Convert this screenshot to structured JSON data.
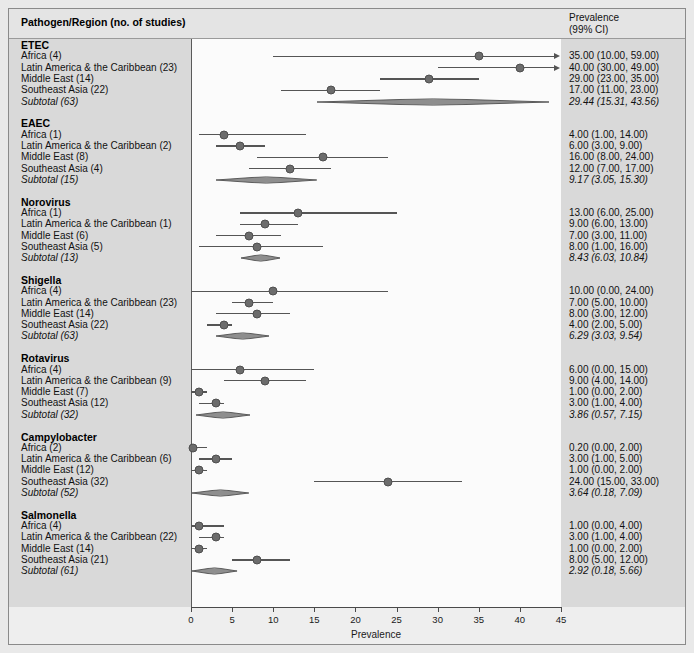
{
  "header": {
    "left_title": "Pathogen/Region (no. of studies)",
    "right_title_line1": "Prevalence",
    "right_title_line2": "(99% CI)"
  },
  "axis": {
    "title": "Prevalence",
    "ticks": [
      "0",
      "5",
      "10",
      "15",
      "20",
      "25",
      "30",
      "35",
      "40",
      "45"
    ],
    "min": 0,
    "max": 45
  },
  "colors": {
    "marker": "#6c6c6c",
    "line": "#555555",
    "panel": "#fbfbfb",
    "band": "#d9d9d9",
    "figure_bg": "#eeeeee"
  },
  "chart_data": {
    "type": "forest",
    "title": "",
    "xlabel": "Prevalence",
    "ylabel": "",
    "xlim": [
      0,
      45
    ],
    "grid": false,
    "legend": "none",
    "ci_level": "99% CI",
    "groups": [
      {
        "name": "ETEC",
        "rows": [
          {
            "label": "Africa (4)",
            "studies": 4,
            "est": 35.0,
            "lo": 10.0,
            "hi": 59.0,
            "text": "35.00 (10.00, 59.00)",
            "truncated_right": true,
            "subtotal": false
          },
          {
            "label": "Latin America & the Caribbean (23)",
            "studies": 23,
            "est": 40.0,
            "lo": 30.0,
            "hi": 49.0,
            "text": "40.00 (30.00, 49.00)",
            "truncated_right": true,
            "subtotal": false
          },
          {
            "label": "Middle East (14)",
            "studies": 14,
            "est": 29.0,
            "lo": 23.0,
            "hi": 35.0,
            "text": "29.00 (23.00, 35.00)",
            "truncated_right": false,
            "subtotal": false
          },
          {
            "label": "Southeast Asia (22)",
            "studies": 22,
            "est": 17.0,
            "lo": 11.0,
            "hi": 23.0,
            "text": "17.00 (11.00, 23.00)",
            "truncated_right": false,
            "subtotal": false
          },
          {
            "label": "Subtotal  (63)",
            "studies": 63,
            "est": 29.44,
            "lo": 15.31,
            "hi": 43.56,
            "text": "29.44 (15.31, 43.56)",
            "truncated_right": false,
            "subtotal": true
          }
        ]
      },
      {
        "name": "EAEC",
        "rows": [
          {
            "label": "Africa (1)",
            "studies": 1,
            "est": 4.0,
            "lo": 1.0,
            "hi": 14.0,
            "text": "4.00 (1.00, 14.00)",
            "truncated_right": false,
            "subtotal": false
          },
          {
            "label": "Latin America & the Caribbean (2)",
            "studies": 2,
            "est": 6.0,
            "lo": 3.0,
            "hi": 9.0,
            "text": "6.00 (3.00, 9.00)",
            "truncated_right": false,
            "subtotal": false
          },
          {
            "label": "Middle East (8)",
            "studies": 8,
            "est": 16.0,
            "lo": 8.0,
            "hi": 24.0,
            "text": "16.00 (8.00, 24.00)",
            "truncated_right": false,
            "subtotal": false
          },
          {
            "label": "Southeast Asia (4)",
            "studies": 4,
            "est": 12.0,
            "lo": 7.0,
            "hi": 17.0,
            "text": "12.00 (7.00, 17.00)",
            "truncated_right": false,
            "subtotal": false
          },
          {
            "label": "Subtotal (15)",
            "studies": 15,
            "est": 9.17,
            "lo": 3.05,
            "hi": 15.3,
            "text": "9.17 (3.05, 15.30)",
            "truncated_right": false,
            "subtotal": true
          }
        ]
      },
      {
        "name": "Norovirus",
        "rows": [
          {
            "label": "Africa (1)",
            "studies": 1,
            "est": 13.0,
            "lo": 6.0,
            "hi": 25.0,
            "text": "13.00 (6.00, 25.00)",
            "truncated_right": false,
            "subtotal": false
          },
          {
            "label": "Latin America & the Caribbean (1)",
            "studies": 1,
            "est": 9.0,
            "lo": 6.0,
            "hi": 13.0,
            "text": "9.00 (6.00, 13.00)",
            "truncated_right": false,
            "subtotal": false
          },
          {
            "label": "Middle East (6)",
            "studies": 6,
            "est": 7.0,
            "lo": 3.0,
            "hi": 11.0,
            "text": "7.00 (3.00, 11.00)",
            "truncated_right": false,
            "subtotal": false
          },
          {
            "label": "Southeast Asia (5)",
            "studies": 5,
            "est": 8.0,
            "lo": 1.0,
            "hi": 16.0,
            "text": "8.00 (1.00, 16.00)",
            "truncated_right": false,
            "subtotal": false
          },
          {
            "label": "Subtotal (13)",
            "studies": 13,
            "est": 8.43,
            "lo": 6.03,
            "hi": 10.84,
            "text": "8.43 (6.03, 10.84)",
            "truncated_right": false,
            "subtotal": true
          }
        ]
      },
      {
        "name": "Shigella",
        "rows": [
          {
            "label": "Africa (4)",
            "studies": 4,
            "est": 10.0,
            "lo": 0.0,
            "hi": 24.0,
            "text": "10.00 (0.00, 24.00)",
            "truncated_right": false,
            "subtotal": false
          },
          {
            "label": "Latin America & the Caribbean (23)",
            "studies": 23,
            "est": 7.0,
            "lo": 5.0,
            "hi": 10.0,
            "text": "7.00 (5.00, 10.00)",
            "truncated_right": false,
            "subtotal": false
          },
          {
            "label": "Middle East (14)",
            "studies": 14,
            "est": 8.0,
            "lo": 3.0,
            "hi": 12.0,
            "text": "8.00 (3.00, 12.00)",
            "truncated_right": false,
            "subtotal": false
          },
          {
            "label": "Southeast Asia (22)",
            "studies": 22,
            "est": 4.0,
            "lo": 2.0,
            "hi": 5.0,
            "text": "4.00 (2.00, 5.00)",
            "truncated_right": false,
            "subtotal": false
          },
          {
            "label": "Subtotal (63)",
            "studies": 63,
            "est": 6.29,
            "lo": 3.03,
            "hi": 9.54,
            "text": "6.29 (3.03, 9.54)",
            "truncated_right": false,
            "subtotal": true
          }
        ]
      },
      {
        "name": "Rotavirus",
        "rows": [
          {
            "label": "Africa (4)",
            "studies": 4,
            "est": 6.0,
            "lo": 0.0,
            "hi": 15.0,
            "text": "6.00 (0.00, 15.00)",
            "truncated_right": false,
            "subtotal": false
          },
          {
            "label": "Latin America & the Caribbean (9)",
            "studies": 9,
            "est": 9.0,
            "lo": 4.0,
            "hi": 14.0,
            "text": "9.00 (4.00, 14.00)",
            "truncated_right": false,
            "subtotal": false
          },
          {
            "label": "Middle East (7)",
            "studies": 7,
            "est": 1.0,
            "lo": 0.0,
            "hi": 2.0,
            "text": "1.00 (0.00, 2.00)",
            "truncated_right": false,
            "subtotal": false
          },
          {
            "label": "Southeast Asia (12)",
            "studies": 12,
            "est": 3.0,
            "lo": 1.0,
            "hi": 4.0,
            "text": "3.00 (1.00, 4.00)",
            "truncated_right": false,
            "subtotal": false
          },
          {
            "label": "Subtotal (32)",
            "studies": 32,
            "est": 3.86,
            "lo": 0.57,
            "hi": 7.15,
            "text": "3.86 (0.57, 7.15)",
            "truncated_right": false,
            "subtotal": true
          }
        ]
      },
      {
        "name": "Campylobacter",
        "rows": [
          {
            "label": "Africa (2)",
            "studies": 2,
            "est": 0.2,
            "lo": 0.0,
            "hi": 2.0,
            "text": "0.20 (0.00, 2.00)",
            "truncated_right": false,
            "subtotal": false
          },
          {
            "label": "Latin America & the Caribbean (6)",
            "studies": 6,
            "est": 3.0,
            "lo": 1.0,
            "hi": 5.0,
            "text": "3.00 (1.00, 5.00)",
            "truncated_right": false,
            "subtotal": false
          },
          {
            "label": "Middle East (12)",
            "studies": 12,
            "est": 1.0,
            "lo": 0.0,
            "hi": 2.0,
            "text": "1.00 (0.00, 2.00)",
            "truncated_right": false,
            "subtotal": false
          },
          {
            "label": "Southeast Asia (32)",
            "studies": 32,
            "est": 24.0,
            "lo": 15.0,
            "hi": 33.0,
            "text": "24.00 (15.00, 33.00)",
            "truncated_right": false,
            "subtotal": false
          },
          {
            "label": "Subtotal (52)",
            "studies": 52,
            "est": 3.64,
            "lo": 0.18,
            "hi": 7.09,
            "text": "3.64 (0.18, 7.09)",
            "truncated_right": false,
            "subtotal": true
          }
        ]
      },
      {
        "name": "Salmonella",
        "rows": [
          {
            "label": "Africa (4)",
            "studies": 4,
            "est": 1.0,
            "lo": 0.0,
            "hi": 4.0,
            "text": "1.00 (0.00, 4.00)",
            "truncated_right": false,
            "subtotal": false
          },
          {
            "label": "Latin America & the Caribbean (22)",
            "studies": 22,
            "est": 3.0,
            "lo": 1.0,
            "hi": 4.0,
            "text": "3.00 (1.00, 4.00)",
            "truncated_right": false,
            "subtotal": false
          },
          {
            "label": "Middle East (14)",
            "studies": 14,
            "est": 1.0,
            "lo": 0.0,
            "hi": 2.0,
            "text": "1.00 (0.00, 2.00)",
            "truncated_right": false,
            "subtotal": false
          },
          {
            "label": "Southeast Asia (21)",
            "studies": 21,
            "est": 8.0,
            "lo": 5.0,
            "hi": 12.0,
            "text": "8.00 (5.00, 12.00)",
            "truncated_right": false,
            "subtotal": false
          },
          {
            "label": "Subtotal (61)",
            "studies": 61,
            "est": 2.92,
            "lo": 0.18,
            "hi": 5.66,
            "text": "2.92 (0.18, 5.66)",
            "truncated_right": false,
            "subtotal": true
          }
        ]
      }
    ]
  }
}
